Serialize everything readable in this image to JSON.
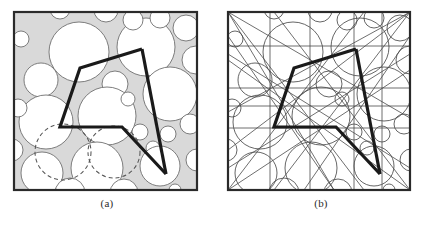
{
  "figure": {
    "width": 428,
    "height": 226,
    "background": "#ffffff",
    "panels": [
      {
        "id": "a",
        "caption": "(a)",
        "description": "Circle packing with shaded interstitial curvilinear triangles, two dashed query circles and a bold polyline path"
      },
      {
        "id": "b",
        "caption": "(b)",
        "description": "Same configuration rendered as an arrangement of circles and tangent lines with the identical bold polyline path"
      }
    ]
  },
  "style": {
    "frame_color": "#2a2a2a",
    "frame_width": 2.2,
    "circle_stroke": "#6f6f6f",
    "circle_stroke_width": 0.9,
    "circle_fill": "#ffffff",
    "gap_fill": "#d9d9d9",
    "gap_stroke": "#8a8a8a",
    "dashed_stroke": "#555555",
    "dashed_dasharray": "4 3",
    "path_color": "#1a1a1a",
    "path_width": 3.2,
    "line_arrangement_stroke": "#4a4a4a",
    "line_arrangement_width": 0.8,
    "caption_color": "#2b2b2b"
  },
  "geometry": {
    "frame": {
      "x": 13,
      "y": 11,
      "w": 185,
      "h": 180
    },
    "frame_b": {
      "x": 227,
      "y": 11,
      "w": 184,
      "h": 180
    },
    "polyline_points": "142,49 80,68 60,127 122,127 166,174",
    "circles": [
      {
        "cx": 79,
        "cy": 52,
        "r": 30
      },
      {
        "cx": 146,
        "cy": 47,
        "r": 29
      },
      {
        "cx": 41,
        "cy": 80,
        "r": 17
      },
      {
        "cx": 115,
        "cy": 84,
        "r": 13
      },
      {
        "cx": 46,
        "cy": 122,
        "r": 27
      },
      {
        "cx": 107,
        "cy": 116,
        "r": 29
      },
      {
        "cx": 170,
        "cy": 94,
        "r": 27
      },
      {
        "cx": 18,
        "cy": 108,
        "r": 9
      },
      {
        "cx": 140,
        "cy": 132,
        "r": 8
      },
      {
        "cx": 168,
        "cy": 134,
        "r": 8
      },
      {
        "cx": 190,
        "cy": 124,
        "r": 10
      },
      {
        "cx": 153,
        "cy": 148,
        "r": 7
      },
      {
        "cx": 97,
        "cy": 168,
        "r": 26
      },
      {
        "cx": 160,
        "cy": 166,
        "r": 20
      },
      {
        "cx": 42,
        "cy": 173,
        "r": 21
      },
      {
        "cx": 133,
        "cy": 20,
        "r": 10
      },
      {
        "cx": 160,
        "cy": 18,
        "r": 10
      },
      {
        "cx": 186,
        "cy": 28,
        "r": 13
      },
      {
        "cx": 175,
        "cy": 190,
        "r": 6
      },
      {
        "cx": 21,
        "cy": 39,
        "r": 8
      },
      {
        "cx": 128,
        "cy": 99,
        "r": 7
      }
    ],
    "dashed_circles": [
      {
        "cx": 63,
        "cy": 152,
        "r": 28
      },
      {
        "cx": 114,
        "cy": 152,
        "r": 26
      }
    ]
  },
  "colors": {
    "ink": "#1a1a1a",
    "gap_gray": "#d9d9d9",
    "outline_gray": "#6f6f6f"
  }
}
